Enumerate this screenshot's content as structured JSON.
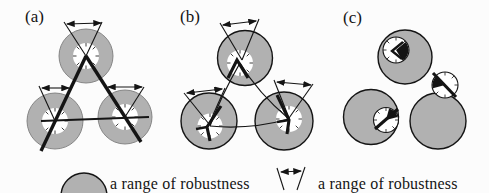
{
  "figure": {
    "type": "paper-figure-diagram",
    "panels": [
      {
        "id": "a",
        "label": "(a)"
      },
      {
        "id": "b",
        "label": "(b)"
      },
      {
        "id": "c",
        "label": "(c)"
      }
    ],
    "legend": {
      "items": [
        {
          "symbol": "gray-circle",
          "label": "a range of robustness"
        },
        {
          "symbol": "angular-range-arrow",
          "label": "a range of robustness"
        }
      ]
    },
    "colors": {
      "circle_gray": "#b1b1b1",
      "ink": "#141414",
      "background": "#fcfcfc"
    }
  }
}
